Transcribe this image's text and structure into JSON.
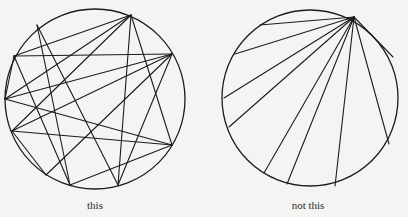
{
  "figures": [
    {
      "id": "left",
      "caption": "this",
      "caption_pos": [
        95,
        199
      ],
      "circle": {
        "cx": 95,
        "cy": 99,
        "r": 90
      },
      "points": [
        [
          131,
          15
        ],
        [
          37,
          25
        ],
        [
          14,
          56
        ],
        [
          5,
          99
        ],
        [
          12,
          131
        ],
        [
          46,
          175
        ],
        [
          70,
          185
        ],
        [
          118,
          185
        ],
        [
          172,
          145
        ],
        [
          172,
          54
        ]
      ],
      "chords": [
        [
          [
            131,
            15
          ],
          [
            14,
            56
          ]
        ],
        [
          [
            131,
            15
          ],
          [
            5,
            99
          ]
        ],
        [
          [
            131,
            15
          ],
          [
            12,
            131
          ]
        ],
        [
          [
            131,
            15
          ],
          [
            118,
            185
          ]
        ],
        [
          [
            131,
            15
          ],
          [
            172,
            145
          ]
        ],
        [
          [
            37,
            25
          ],
          [
            118,
            185
          ]
        ],
        [
          [
            37,
            25
          ],
          [
            70,
            185
          ]
        ],
        [
          [
            14,
            56
          ],
          [
            172,
            54
          ]
        ],
        [
          [
            14,
            56
          ],
          [
            5,
            99
          ]
        ],
        [
          [
            14,
            56
          ],
          [
            70,
            185
          ]
        ],
        [
          [
            5,
            99
          ],
          [
            172,
            54
          ]
        ],
        [
          [
            5,
            99
          ],
          [
            172,
            145
          ]
        ],
        [
          [
            12,
            131
          ],
          [
            172,
            54
          ]
        ],
        [
          [
            12,
            131
          ],
          [
            172,
            145
          ]
        ],
        [
          [
            12,
            131
          ],
          [
            46,
            175
          ]
        ],
        [
          [
            46,
            175
          ],
          [
            172,
            54
          ]
        ],
        [
          [
            70,
            185
          ],
          [
            172,
            145
          ]
        ],
        [
          [
            118,
            185
          ],
          [
            172,
            54
          ]
        ]
      ]
    },
    {
      "id": "right",
      "caption": "not this",
      "caption_pos": [
        308,
        199
      ],
      "circle": {
        "cx": 310,
        "cy": 98,
        "r": 88
      },
      "hub": [
        354,
        17
      ],
      "endpoints": [
        [
          260,
          25
        ],
        [
          235,
          54
        ],
        [
          224,
          98
        ],
        [
          229,
          127
        ],
        [
          264,
          173
        ],
        [
          287,
          184
        ],
        [
          335,
          186
        ],
        [
          389,
          144
        ],
        [
          393,
          57
        ]
      ]
    }
  ],
  "style": {
    "stroke": "#1c1c1c",
    "background": "#f4f4f2"
  }
}
